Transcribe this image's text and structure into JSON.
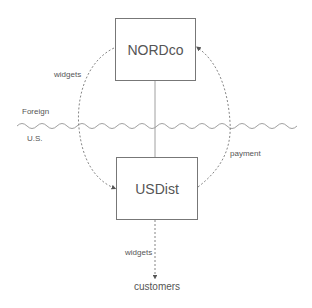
{
  "diagram": {
    "nodes": {
      "top": {
        "label": "NORDco"
      },
      "bottom": {
        "label": "USDist"
      },
      "sink": {
        "label": "customers"
      }
    },
    "regions": {
      "upper": "Foreign",
      "lower": "U.S."
    },
    "flows": {
      "left_arc": "widgets",
      "right_arc": "payment",
      "bottom": "widgets"
    },
    "colors": {
      "line": "#777777",
      "text": "#555555"
    }
  }
}
